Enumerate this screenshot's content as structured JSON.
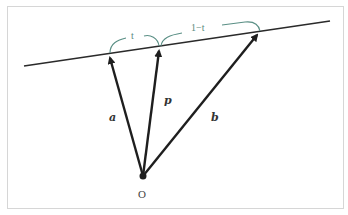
{
  "diagram": {
    "type": "vector-line-parametrization",
    "colors": {
      "line": "#2a2a2a",
      "arrow": "#1e1e1e",
      "brace": "#5a8f85",
      "border": "#d6d6d6"
    },
    "origin": {
      "label": "O"
    },
    "vectors": [
      {
        "id": "a",
        "label": "a"
      },
      {
        "id": "p",
        "label": "p"
      },
      {
        "id": "b",
        "label": "b"
      }
    ],
    "braces": [
      {
        "id": "brace-t",
        "label": "t"
      },
      {
        "id": "brace-1-minus-t",
        "label": "1−t"
      }
    ]
  }
}
